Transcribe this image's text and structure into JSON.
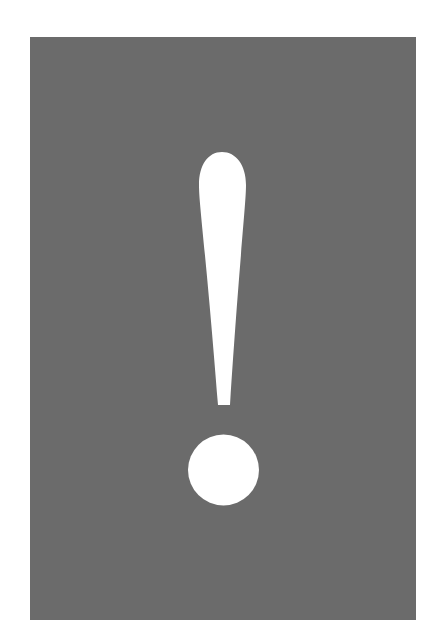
{
  "image": {
    "subject": "exclamation mark",
    "alt_text": "!"
  },
  "colors": {
    "page_background": "#ffffff",
    "panel_background": "#6b6b6b",
    "glyph_fill": "#ffffff"
  },
  "icon": {
    "semantic_name": "exclamation-icon",
    "glyph": "!"
  }
}
